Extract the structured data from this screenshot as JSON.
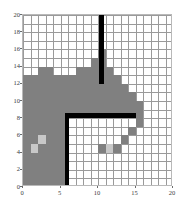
{
  "chart_data": {
    "type": "heatmap",
    "title": "",
    "subtitle": "",
    "xlabel": "",
    "ylabel": "",
    "xlim": [
      0,
      20
    ],
    "ylim": [
      0,
      20
    ],
    "grid": true,
    "legend_position": "none",
    "cell_size": 1,
    "xticks": [
      0,
      5,
      10,
      15,
      20
    ],
    "yticks": [
      0,
      2,
      4,
      6,
      8,
      10,
      12,
      14,
      16,
      18,
      20
    ],
    "xtick_labels": [
      "0",
      "5",
      "10",
      "15",
      "20"
    ],
    "ytick_labels": [
      "0",
      "2",
      "4",
      "6",
      "8",
      "10",
      "12",
      "14",
      "16",
      "18",
      "20"
    ],
    "value_colors": {
      "free": "#ffffff",
      "occupied_light": "#c8c8c8",
      "occupied_mid": "#808080",
      "wall": "#000000",
      "gridline": "#9a9a9a",
      "axis": "#b9b9b9",
      "tick_text": "#3a3a3a"
    },
    "annotations": [],
    "occupied_regions": [
      {
        "x0": 0,
        "y0": 0,
        "x1": 6,
        "y1": 13,
        "value": "occupied_mid"
      },
      {
        "x0": 2,
        "y0": 13,
        "x1": 4,
        "y1": 14,
        "value": "occupied_mid"
      },
      {
        "x0": 6,
        "y0": 8,
        "x1": 7,
        "y1": 13,
        "value": "occupied_mid"
      },
      {
        "x0": 7,
        "y0": 8,
        "x1": 8,
        "y1": 14,
        "value": "occupied_mid"
      },
      {
        "x0": 8,
        "y0": 8,
        "x1": 9,
        "y1": 14,
        "value": "occupied_mid"
      },
      {
        "x0": 9,
        "y0": 8,
        "x1": 10,
        "y1": 15,
        "value": "occupied_mid"
      },
      {
        "x0": 10,
        "y0": 8,
        "x1": 11,
        "y1": 16,
        "value": "occupied_mid"
      },
      {
        "x0": 11,
        "y0": 8,
        "x1": 12,
        "y1": 14,
        "value": "occupied_mid"
      },
      {
        "x0": 12,
        "y0": 8,
        "x1": 13,
        "y1": 13,
        "value": "occupied_mid"
      },
      {
        "x0": 13,
        "y0": 8,
        "x1": 14,
        "y1": 12,
        "value": "occupied_mid"
      },
      {
        "x0": 14,
        "y0": 8,
        "x1": 15,
        "y1": 11,
        "value": "occupied_mid"
      },
      {
        "x0": 15,
        "y0": 7,
        "x1": 16,
        "y1": 10,
        "value": "occupied_mid"
      },
      {
        "x0": 14,
        "y0": 6,
        "x1": 15,
        "y1": 7,
        "value": "occupied_mid"
      },
      {
        "x0": 13,
        "y0": 5,
        "x1": 14,
        "y1": 6,
        "value": "occupied_mid"
      },
      {
        "x0": 10,
        "y0": 4,
        "x1": 13,
        "y1": 5,
        "value": "occupied_mid"
      },
      {
        "x0": 1,
        "y0": 4,
        "x1": 2,
        "y1": 5,
        "value": "occupied_light"
      },
      {
        "x0": 2,
        "y0": 5,
        "x1": 3,
        "y1": 6,
        "value": "occupied_light"
      },
      {
        "x0": 11,
        "y0": 4,
        "x1": 12,
        "y1": 5,
        "value": "occupied_light"
      }
    ],
    "walls": [
      {
        "x0": 10.15,
        "y0": 12,
        "x1": 10.85,
        "y1": 20,
        "value": "wall",
        "orientation": "vertical"
      },
      {
        "x0": 5.55,
        "y0": 0,
        "x1": 6.1,
        "y1": 8.6,
        "value": "wall",
        "orientation": "vertical"
      },
      {
        "x0": 5.55,
        "y0": 8.0,
        "x1": 15.0,
        "y1": 8.6,
        "value": "wall",
        "orientation": "horizontal"
      }
    ]
  }
}
